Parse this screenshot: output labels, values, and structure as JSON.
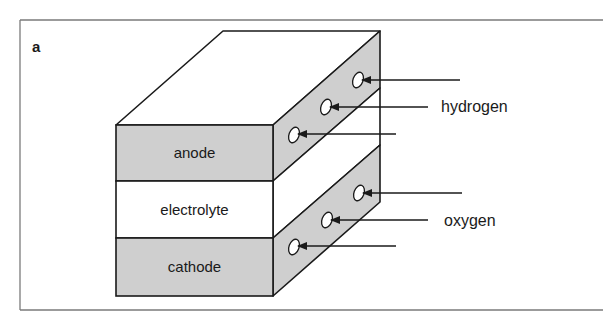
{
  "figure": {
    "panel_label": "a",
    "colors": {
      "frame": "#7a7a7a",
      "stroke": "#1a1a1a",
      "electrode_fill": "#cfcfcf",
      "electrolyte_fill": "#ffffff",
      "port_fill": "#ffffff"
    },
    "layers": [
      {
        "id": "anode",
        "label": "anode"
      },
      {
        "id": "electrolyte",
        "label": "electrolyte"
      },
      {
        "id": "cathode",
        "label": "cathode"
      }
    ],
    "inputs": [
      {
        "id": "hydrogen",
        "label": "hydrogen",
        "arrow_count": 3,
        "target_layer": "anode"
      },
      {
        "id": "oxygen",
        "label": "oxygen",
        "arrow_count": 3,
        "target_layer": "cathode"
      }
    ]
  }
}
